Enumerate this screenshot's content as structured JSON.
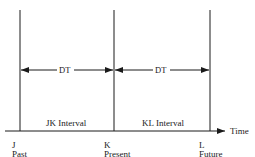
{
  "diagram": {
    "type": "timeline",
    "axis_label": "Time",
    "points": [
      {
        "id": "J",
        "label": "J",
        "sublabel": "Past"
      },
      {
        "id": "K",
        "label": "K",
        "sublabel": "Present"
      },
      {
        "id": "L",
        "label": "L",
        "sublabel": "Future"
      }
    ],
    "intervals": [
      {
        "name": "JK Interval",
        "span_label": "DT"
      },
      {
        "name": "KL Interval",
        "span_label": "DT"
      }
    ]
  }
}
